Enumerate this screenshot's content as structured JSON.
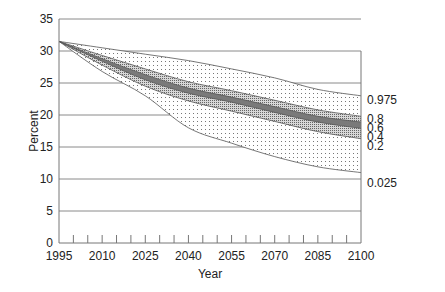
{
  "chart_data": {
    "type": "area",
    "title": "",
    "xlabel": "Year",
    "ylabel": "Percent",
    "xlim": [
      1995,
      2100
    ],
    "ylim": [
      0,
      35
    ],
    "grid": true,
    "x_tick_labels": [
      "1995",
      "2010",
      "2025",
      "2040",
      "2055",
      "2070",
      "2085",
      "2100"
    ],
    "y_tick_labels": [
      "0",
      "5",
      "10",
      "15",
      "20",
      "25",
      "30",
      "35"
    ],
    "x": [
      1995,
      2010,
      2025,
      2040,
      2055,
      2070,
      2085,
      2100
    ],
    "series": [
      {
        "name": "0.975",
        "values": [
          31.5,
          30.5,
          29.5,
          28.5,
          27.2,
          25.8,
          24.0,
          23.0
        ]
      },
      {
        "name": "0.8",
        "values": [
          31.5,
          29.3,
          27.2,
          25.2,
          23.8,
          22.3,
          20.8,
          19.8
        ]
      },
      {
        "name": "0.6",
        "values": [
          31.5,
          28.8,
          26.3,
          24.2,
          22.8,
          21.3,
          19.8,
          18.9
        ]
      },
      {
        "name": "0.4",
        "values": [
          31.5,
          28.4,
          25.5,
          23.4,
          22.0,
          20.4,
          18.9,
          17.9
        ]
      },
      {
        "name": "0.2",
        "values": [
          31.5,
          27.8,
          24.5,
          22.2,
          20.6,
          19.0,
          17.4,
          16.3
        ]
      },
      {
        "name": "0.025",
        "values": [
          31.5,
          26.8,
          23.0,
          18.0,
          15.6,
          13.5,
          11.9,
          11.0
        ]
      }
    ],
    "legend": "quantile labels at right edge of plot",
    "legend_entries": [
      "0.975",
      "0.8",
      "0.6",
      "0.4",
      "0.2",
      "0.025"
    ]
  },
  "axes": {
    "xlabel": "Year",
    "ylabel": "Percent"
  },
  "colors": {
    "grid": "#8a8a8a",
    "outer_band": "#f2f2f2",
    "mid_band": "#b8b8b8",
    "inner_band": "#7a7a7a",
    "line": "#555555"
  }
}
